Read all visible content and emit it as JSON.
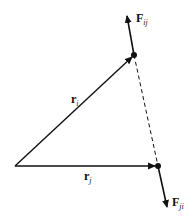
{
  "diagram": {
    "type": "vector-diagram",
    "colors": {
      "stroke": "#111111",
      "background": "#ffffff"
    },
    "origin": {
      "x": 15,
      "y": 166
    },
    "particles": [
      {
        "id": "i",
        "x": 134,
        "y": 55
      },
      {
        "id": "j",
        "x": 158,
        "y": 166
      }
    ],
    "vectors": [
      {
        "id": "r_i",
        "label": "r",
        "subscript": "i",
        "from": "origin",
        "to": "i"
      },
      {
        "id": "r_j",
        "label": "r",
        "subscript": "j",
        "from": "origin",
        "to": "j"
      },
      {
        "id": "F_ij",
        "label": "F",
        "subscript": "ij",
        "from": "i",
        "direction": "away-from-j"
      },
      {
        "id": "F_ji",
        "label": "F",
        "subscript": "ji",
        "from": "j",
        "direction": "away-from-i"
      }
    ],
    "connector": {
      "from": "i",
      "to": "j",
      "style": "dashed"
    },
    "labels": {
      "r_i": {
        "main": "r",
        "sub": "i"
      },
      "r_j": {
        "main": "r",
        "sub": "j"
      },
      "F_ij": {
        "main": "F",
        "sub": "ij"
      },
      "F_ji": {
        "main": "F",
        "sub": "ji"
      }
    }
  }
}
